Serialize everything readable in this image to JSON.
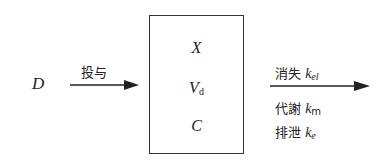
{
  "diagram": {
    "input": {
      "symbol": "D",
      "arrow_label": "投与"
    },
    "compartment": {
      "variables": [
        {
          "main": "X",
          "sub": ""
        },
        {
          "main": "V",
          "sub": "d"
        },
        {
          "main": "C",
          "sub": ""
        }
      ]
    },
    "output": {
      "arrow_label": {
        "text": "消失",
        "k": "k",
        "sub": "el"
      },
      "routes": [
        {
          "text": "代謝",
          "k": "k",
          "sub": "m"
        },
        {
          "text": "排泄",
          "k": "k",
          "sub": "e"
        }
      ]
    }
  }
}
